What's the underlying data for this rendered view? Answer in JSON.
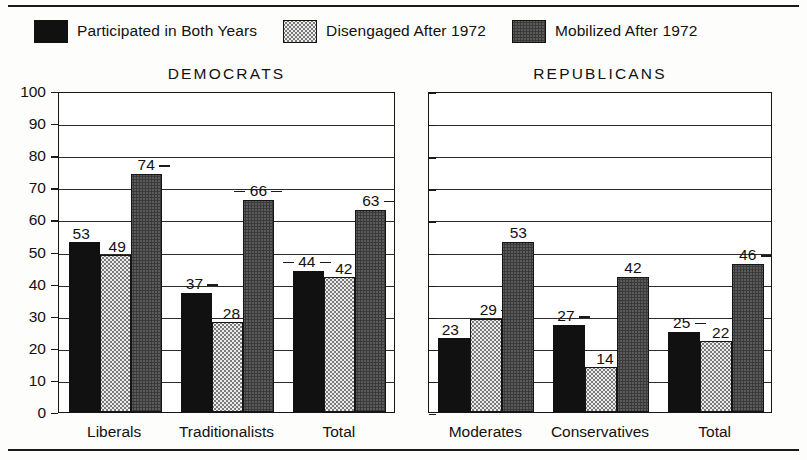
{
  "chart_data": {
    "type": "bar",
    "title": "",
    "xlabel": "",
    "ylabel": "",
    "ylim": [
      0,
      100
    ],
    "ytick_step": 10,
    "grid": true,
    "legend_position": "top",
    "legend": [
      {
        "label": "Participated in Both Years",
        "swatch": "solid-black"
      },
      {
        "label": "Disengaged After 1972",
        "swatch": "light-stipple"
      },
      {
        "label": "Mobilized After 1972",
        "swatch": "mid-checker"
      }
    ],
    "yticks": [
      "100",
      "90",
      "80",
      "70",
      "60",
      "50",
      "40",
      "30",
      "20",
      "10",
      "0"
    ],
    "panels": [
      {
        "name": "DEMOCRATS",
        "show_yaxis": true,
        "categories": [
          "Liberals",
          "Traditionalists",
          "Total"
        ],
        "series": [
          {
            "name": "Participated in Both Years",
            "values": [
              53,
              37,
              44
            ]
          },
          {
            "name": "Disengaged After 1972",
            "values": [
              49,
              28,
              42
            ]
          },
          {
            "name": "Mobilized After 1972",
            "values": [
              74,
              66,
              63
            ]
          }
        ]
      },
      {
        "name": "REPUBLICANS",
        "show_yaxis": false,
        "categories": [
          "Moderates",
          "Conservatives",
          "Total"
        ],
        "series": [
          {
            "name": "Participated in Both Years",
            "values": [
              23,
              27,
              25
            ]
          },
          {
            "name": "Disengaged After 1972",
            "values": [
              29,
              14,
              22
            ]
          },
          {
            "name": "Mobilized After 1972",
            "values": [
              53,
              42,
              46
            ]
          }
        ]
      }
    ]
  },
  "colors": {
    "ink": "#111111",
    "series_solid": "#111111",
    "series_light": "#ececec",
    "series_mid": "#bdbdbd",
    "background": "#fdfdfb"
  }
}
